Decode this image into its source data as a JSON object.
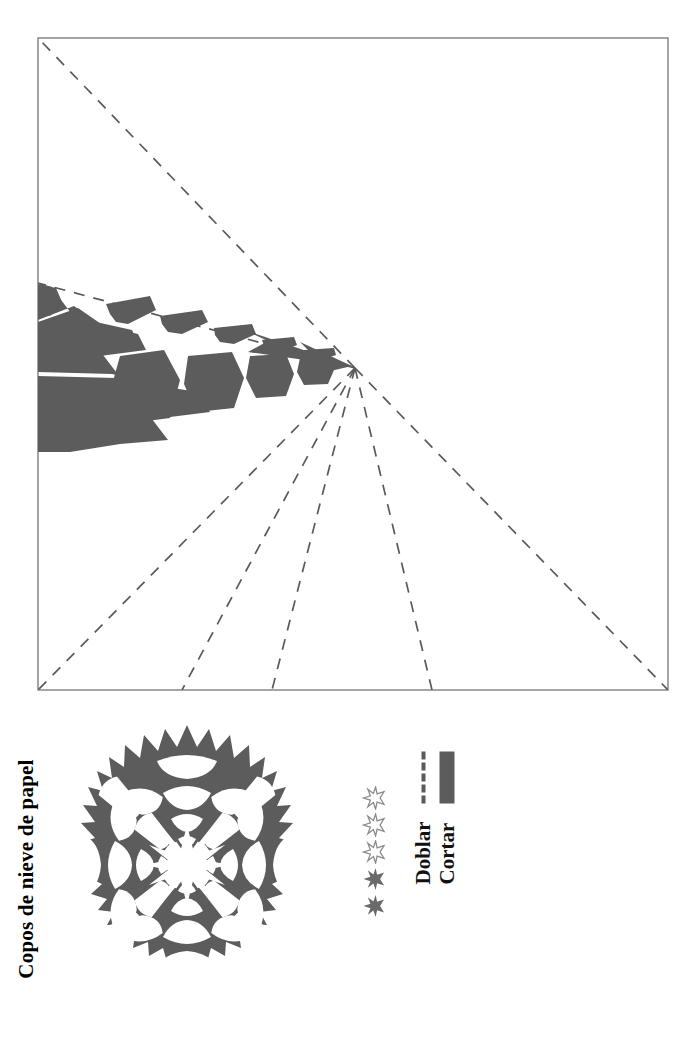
{
  "page": {
    "title": "Copos de nieve de papel",
    "language": "es",
    "orientation": "rotated-90-ccw"
  },
  "colors": {
    "cut_fill": "#5c5c5c",
    "fold_line": "#5a5a5a",
    "border": "#7a7a7a",
    "paper": "#f2f2f0",
    "ink": "#1a1a1a"
  },
  "template": {
    "name": "snowflake-fold-and-cut-template",
    "shape": "square",
    "border_style": "solid thin",
    "fold_lines_label": "Doblar",
    "cut_regions_label": "Cortar",
    "vertex": {
      "x": 355,
      "y": 368
    },
    "square": {
      "left": 38,
      "top": 38,
      "right": 668,
      "bottom": 690
    },
    "fold_line_count": 7,
    "wedge_description": "Cut-out pattern wedge on the left side converging at the fold vertex"
  },
  "legend": {
    "items": [
      {
        "id": "fold",
        "label": "Doblar",
        "style": "dashed-line"
      },
      {
        "id": "cut",
        "label": "Cortar",
        "style": "solid-fill"
      }
    ]
  },
  "difficulty": {
    "label": "difficulty-rating",
    "max": 5,
    "filled": 2,
    "stars": [
      "filled",
      "filled",
      "outline",
      "outline",
      "outline"
    ]
  },
  "steps": {
    "count": 6,
    "items": [
      {
        "number": "1",
        "art": "square-with-diagonal-fold",
        "caption": ""
      },
      {
        "number": "2",
        "art": "triangle-fold-arrow",
        "caption": ""
      },
      {
        "number": "3",
        "art": "triangle-with-dashed-thirds",
        "caption": ""
      },
      {
        "number": "4",
        "art": "wedge-fold-arrow-up",
        "caption": ""
      },
      {
        "number": "5",
        "art": "wedge-fold-arrow-over",
        "caption": ""
      },
      {
        "number": "6",
        "art": "scissors-cutting-wedge",
        "caption": ""
      }
    ]
  },
  "icons": {
    "scissors": "scissors-icon",
    "snowflake_sample": "snowflake-illustration"
  },
  "sample": {
    "name": "finished-snowflake",
    "points": 24,
    "description": "Finished paper snowflake with radial lace pattern and starburst center"
  }
}
